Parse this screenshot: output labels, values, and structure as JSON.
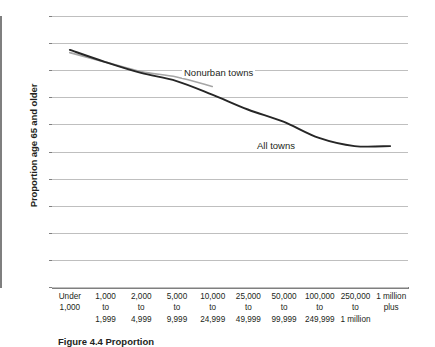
{
  "chart_data": {
    "type": "line",
    "title": "",
    "xlabel": "",
    "ylabel": "Proportion age 65 and older",
    "ylim": [
      0,
      0.2
    ],
    "ytick_step": 0.02,
    "grid": true,
    "legend_position": "inline-labels",
    "categories": [
      "Under\n1,000",
      "1,000\nto\n1,999",
      "2,000\nto\n4,999",
      "5,000\nto\n9,999",
      "10,000\nto\n24,999",
      "25,000\nto\n49,999",
      "50,000\nto\n99,999",
      "100,000\nto\n249,999",
      "250,000\nto\n1 million",
      "1 million\nplus"
    ],
    "ytick_labels": [
      "0.20",
      "0.18",
      "0.16",
      "0.14",
      "0.12",
      "0.10",
      "0.08",
      "0.06",
      "0.04",
      "0.02",
      "0"
    ],
    "ytick_values": [
      0.2,
      0.18,
      0.16,
      0.14,
      0.12,
      0.1,
      0.08,
      0.06,
      0.04,
      0.02,
      0
    ],
    "series": [
      {
        "name": "All towns",
        "color": "#262626",
        "values": [
          0.175,
          0.166,
          0.158,
          0.152,
          0.142,
          0.131,
          0.122,
          0.11,
          0.104,
          0.104
        ]
      },
      {
        "name": "Nonurban towns",
        "color": "#a6a6a6",
        "values": [
          0.173,
          0.166,
          0.159,
          0.155,
          0.148,
          null,
          null,
          null,
          null,
          null
        ]
      }
    ],
    "annotations": [
      {
        "text": "Nonurban towns",
        "series": "Nonurban towns"
      },
      {
        "text": "All towns",
        "series": "All towns"
      }
    ]
  },
  "axis": {
    "y_title": "Proportion age 65 and older",
    "axis_color": "#7f7f7f",
    "grid_color": "#bfbfbf"
  },
  "caption": {
    "text": "Figure 4.4 Proportion"
  }
}
